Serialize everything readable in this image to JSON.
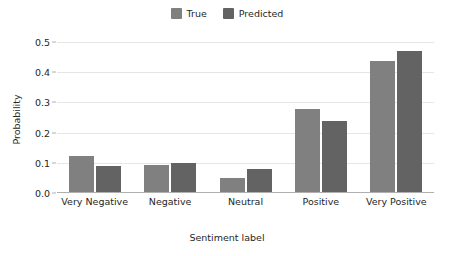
{
  "chart_data": {
    "type": "bar",
    "title": "",
    "subtitle": "",
    "xlabel": "Sentiment label",
    "ylabel": "Probability",
    "categories": [
      "Very Negative",
      "Negative",
      "Neutral",
      "Positive",
      "Very Positive"
    ],
    "series": [
      {
        "name": "True",
        "color": "#808080",
        "values": [
          0.124,
          0.094,
          0.05,
          0.278,
          0.437
        ]
      },
      {
        "name": "Predicted",
        "color": "#636363",
        "values": [
          0.091,
          0.1,
          0.079,
          0.239,
          0.471
        ]
      }
    ],
    "ylim": [
      0.0,
      0.5
    ],
    "yticks": [
      0.0,
      0.1,
      0.2,
      0.3,
      0.4,
      0.5
    ],
    "ytick_labels": [
      "0.0",
      "0.1",
      "0.2",
      "0.3",
      "0.4",
      "0.5"
    ],
    "grid": "horizontal",
    "gridcolor": "#e6e6e6",
    "legend_position": "top-center",
    "legend_orientation": "horizontal",
    "background": "#ffffff",
    "axis_color": "#b0b0b0",
    "text_color": "#262626"
  },
  "legend": {
    "entries": [
      {
        "label": "True",
        "color": "#808080"
      },
      {
        "label": "Predicted",
        "color": "#636363"
      }
    ]
  },
  "axes": {
    "y_title": "Probability",
    "x_title": "Sentiment label"
  }
}
